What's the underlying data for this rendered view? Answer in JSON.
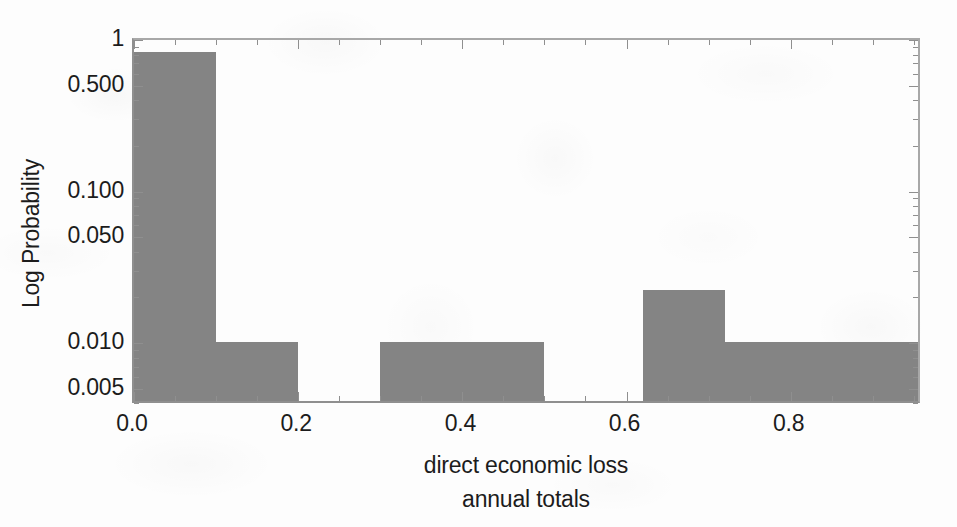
{
  "chart_data": {
    "type": "bar",
    "title": "",
    "subtitle": "",
    "xlabel": "direct economic loss",
    "xlabel_line2": "annual totals",
    "ylabel": "Log Probability",
    "yscale": "log",
    "xlim": [
      0.0,
      0.96
    ],
    "ylim": [
      0.0039,
      1.0
    ],
    "grid": false,
    "legend": null,
    "bar_color": "#848484",
    "axis_color": "#8f8f8f",
    "text_color": "#1c1c1c",
    "background_color": "#fdfdfd",
    "bin_edges": [
      0.0,
      0.1,
      0.2,
      0.3,
      0.5,
      0.62,
      0.72,
      0.96
    ],
    "bins": [
      {
        "x0": 0.0,
        "x1": 0.1,
        "value": 0.78
      },
      {
        "x0": 0.1,
        "x1": 0.2,
        "value": 0.0095
      },
      {
        "x0": 0.2,
        "x1": 0.3,
        "value": 0
      },
      {
        "x0": 0.3,
        "x1": 0.5,
        "value": 0.0095
      },
      {
        "x0": 0.5,
        "x1": 0.62,
        "value": 0
      },
      {
        "x0": 0.62,
        "x1": 0.72,
        "value": 0.021
      },
      {
        "x0": 0.72,
        "x1": 0.96,
        "value": 0.0095
      }
    ],
    "categories": [
      "0.0-0.1",
      "0.1-0.2",
      "0.2-0.3",
      "0.3-0.5",
      "0.5-0.62",
      "0.62-0.72",
      "0.72-0.96"
    ],
    "values": [
      0.78,
      0.0095,
      0,
      0.0095,
      0,
      0.021,
      0.0095
    ],
    "ytick_labels": [
      "1",
      "0.500",
      "0.100",
      "0.050",
      "0.010",
      "0.005"
    ],
    "ytick_values": [
      1,
      0.5,
      0.1,
      0.05,
      0.01,
      0.005
    ],
    "yticks_minor": [
      0.9,
      0.8,
      0.7,
      0.6,
      0.4,
      0.3,
      0.2,
      0.09,
      0.08,
      0.07,
      0.06,
      0.04,
      0.03,
      0.02,
      0.009,
      0.008,
      0.007,
      0.006,
      0.004
    ],
    "xtick_labels": [
      "0.0",
      "0.2",
      "0.4",
      "0.6",
      "0.8"
    ],
    "xtick_values": [
      0.0,
      0.2,
      0.4,
      0.6,
      0.8
    ],
    "xticks_minor": [
      0.05,
      0.1,
      0.15,
      0.25,
      0.3,
      0.35,
      0.45,
      0.5,
      0.55,
      0.65,
      0.7,
      0.75,
      0.85,
      0.9,
      0.95
    ]
  }
}
